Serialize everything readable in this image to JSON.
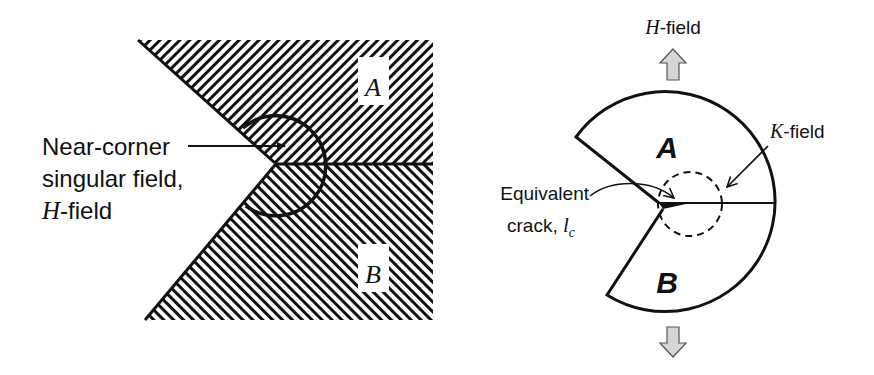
{
  "left_panel": {
    "region_a_label": "A",
    "region_b_label": "B",
    "annotation": {
      "line1": "Near-corner",
      "line2": "singular field,",
      "line3_italic": "H",
      "line3_rest": "-field"
    }
  },
  "right_panel": {
    "h_field_label_italic": "H",
    "h_field_label_rest": "-field",
    "k_field_label_italic": "K",
    "k_field_label_rest": "-field",
    "region_a_label": "A",
    "region_b_label": "B",
    "crack_label": {
      "line1": "Equivalent",
      "line2_prefix": "crack, ",
      "symbol": "l",
      "subscript": "c"
    }
  },
  "colors": {
    "ink": "#111111",
    "arrow_fill": "#d6d6d6",
    "background": "#ffffff"
  }
}
